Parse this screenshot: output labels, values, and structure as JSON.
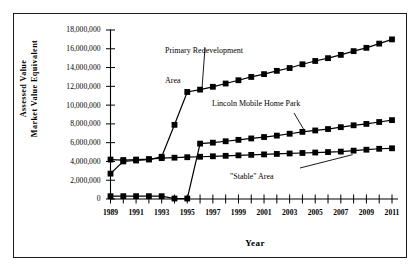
{
  "chart_data": {
    "type": "line",
    "title": "",
    "xlabel": "Year",
    "ylabel": "Assessed Value\nMarket Value Equivalent",
    "ylabel_lines": [
      "Assessed Value",
      "Market Value Equivalent"
    ],
    "xlim": [
      1989,
      2011
    ],
    "ylim": [
      0,
      18000000
    ],
    "ytick_step": 2000000,
    "grid": false,
    "legend": "none (series labeled by annotations with leader lines)",
    "marker": "filled-square",
    "line_color": "#000000",
    "background_color": "#ffffff",
    "yticks": [
      0,
      2000000,
      4000000,
      6000000,
      8000000,
      10000000,
      12000000,
      14000000,
      16000000,
      18000000
    ],
    "ytick_labels": [
      "0",
      "2,000,000",
      "4,000,000",
      "6,000,000",
      "8,000,000",
      "10,000,000",
      "12,000,000",
      "14,000,000",
      "16,000,000",
      "18,000,000"
    ],
    "x": [
      1989,
      1990,
      1991,
      1992,
      1993,
      1994,
      1995,
      1996,
      1997,
      1998,
      1999,
      2000,
      2001,
      2002,
      2003,
      2004,
      2005,
      2006,
      2007,
      2008,
      2009,
      2010,
      2011
    ],
    "xticks_all": [
      1989,
      1990,
      1991,
      1992,
      1993,
      1994,
      1995,
      1996,
      1997,
      1998,
      1999,
      2000,
      2001,
      2002,
      2003,
      2004,
      2005,
      2006,
      2007,
      2008,
      2009,
      2010,
      2011
    ],
    "xtick_labels": [
      "1989",
      "1991",
      "1993",
      "1995",
      "1997",
      "1999",
      "2001",
      "2003",
      "2005",
      "2007",
      "2009",
      "2011"
    ],
    "xtick_labeled_years": [
      1989,
      1991,
      1993,
      1995,
      1997,
      1999,
      2001,
      2003,
      2005,
      2007,
      2009,
      2011
    ],
    "series": [
      {
        "name": "Primary Redevelopment Area",
        "values": [
          2700000,
          4000000,
          4100000,
          4200000,
          4500000,
          7900000,
          11400000,
          11650000,
          11950000,
          12300000,
          12650000,
          13000000,
          13300000,
          13650000,
          13950000,
          14350000,
          14700000,
          15000000,
          15350000,
          15750000,
          16100000,
          16550000,
          17000000
        ]
      },
      {
        "name": "Lincoln Mobile Home Park",
        "values": [
          300000,
          300000,
          300000,
          300000,
          300000,
          50000,
          50000,
          5900000,
          6000000,
          6150000,
          6300000,
          6450000,
          6600000,
          6750000,
          6950000,
          7150000,
          7300000,
          7450000,
          7650000,
          7850000,
          8000000,
          8200000,
          8400000
        ]
      },
      {
        "name": "\"Stable\" Area",
        "values": [
          4200000,
          4150000,
          4200000,
          4250000,
          4350000,
          4400000,
          4450000,
          4500000,
          4550000,
          4600000,
          4650000,
          4700000,
          4750000,
          4800000,
          4850000,
          4900000,
          4950000,
          5000000,
          5050000,
          5150000,
          5250000,
          5350000,
          5400000
        ]
      }
    ],
    "annotations": [
      {
        "text": "Primary Redevelopment\nArea",
        "lines": [
          "Primary Redevelopment",
          "Area"
        ],
        "points_to_year": 1996
      },
      {
        "text": "Lincoln Mobile Home Park",
        "lines": [
          "Lincoln Mobile Home Park"
        ],
        "points_to_year": 2004
      },
      {
        "text": "\"Stable\" Area",
        "lines": [
          "\"Stable\" Area"
        ],
        "points_to_year": 2008
      }
    ]
  },
  "axis": {
    "y_title_line1": "Assessed Value",
    "y_title_line2": "Market Value Equivalent",
    "x_title": "Year"
  },
  "annotations": {
    "primary_line1": "Primary Redevelopment",
    "primary_line2": "Area",
    "lincoln": "Lincoln Mobile Home Park",
    "stable": "\"Stable\" Area"
  }
}
